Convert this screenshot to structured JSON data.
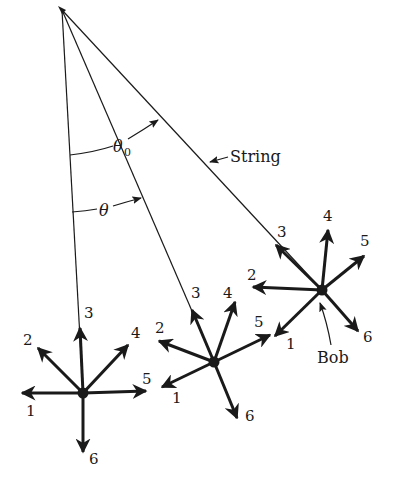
{
  "diagram": {
    "labels": {
      "theta0": "θ",
      "theta0_sub": "0",
      "theta": "θ",
      "string": "String",
      "bob": "Bob"
    },
    "pivot": {
      "x": 62,
      "y": 10
    },
    "positions": [
      {
        "name": "left",
        "bob": {
          "x": 83,
          "y": 393
        },
        "arrows": [
          {
            "id": "1",
            "label": "1",
            "tip": [
              22,
              393
            ],
            "label_pos": [
              26,
              416
            ]
          },
          {
            "id": "2",
            "label": "2",
            "tip": [
              38,
              348
            ],
            "label_pos": [
              23,
              345
            ]
          },
          {
            "id": "3",
            "label": "3",
            "tip": [
              80,
              328
            ],
            "label_pos": [
              84,
              318
            ]
          },
          {
            "id": "4",
            "label": "4",
            "tip": [
              128,
              345
            ],
            "label_pos": [
              131,
              338
            ]
          },
          {
            "id": "5",
            "label": "5",
            "tip": [
              146,
              391
            ],
            "label_pos": [
              142,
              384
            ]
          },
          {
            "id": "6",
            "label": "6",
            "tip": [
              83,
              452
            ],
            "label_pos": [
              89,
              464
            ]
          }
        ]
      },
      {
        "name": "middle",
        "bob": {
          "x": 214,
          "y": 362
        },
        "arrows": [
          {
            "id": "1",
            "label": "1",
            "tip": [
              162,
              387
            ],
            "label_pos": [
              172,
              403
            ]
          },
          {
            "id": "2",
            "label": "2",
            "tip": [
              159,
              341
            ],
            "label_pos": [
              155,
              333
            ]
          },
          {
            "id": "3",
            "label": "3",
            "tip": [
              192,
              310
            ],
            "label_pos": [
              191,
              298
            ]
          },
          {
            "id": "4",
            "label": "4",
            "tip": [
              235,
              302
            ],
            "label_pos": [
              223,
              298
            ]
          },
          {
            "id": "5",
            "label": "5",
            "tip": [
              270,
              335
            ],
            "label_pos": [
              254,
              327
            ]
          },
          {
            "id": "6",
            "label": "6",
            "tip": [
              237,
              418
            ],
            "label_pos": [
              245,
              421
            ]
          }
        ]
      },
      {
        "name": "right",
        "bob": {
          "x": 322,
          "y": 290
        },
        "arrows": [
          {
            "id": "1",
            "label": "1",
            "tip": [
              275,
              336
            ],
            "label_pos": [
              286,
              349
            ]
          },
          {
            "id": "2",
            "label": "2",
            "tip": [
              253,
              287
            ],
            "label_pos": [
              247,
              280
            ]
          },
          {
            "id": "3",
            "label": "3",
            "tip": [
              276,
              245
            ],
            "label_pos": [
              277,
              237
            ]
          },
          {
            "id": "4",
            "label": "4",
            "tip": [
              328,
              230
            ],
            "label_pos": [
              323,
              221
            ]
          },
          {
            "id": "5",
            "label": "5",
            "tip": [
              364,
              256
            ],
            "label_pos": [
              360,
              246
            ]
          },
          {
            "id": "6",
            "label": "6",
            "tip": [
              358,
              331
            ],
            "label_pos": [
              363,
              342
            ]
          }
        ]
      }
    ],
    "colors": {
      "ink": "#1a1a1a",
      "background": "#ffffff"
    }
  }
}
